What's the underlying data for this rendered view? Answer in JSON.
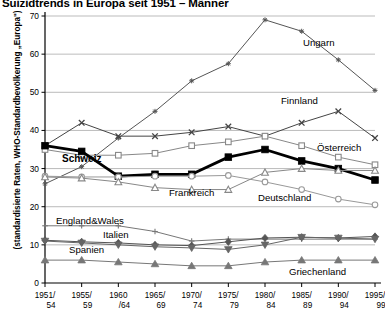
{
  "chart": {
    "title": "Suizidtrends in Europa seit 1951 – Männer",
    "y_axis_title": "(standardisierte Raten, WHO-Standardbevölkerung „Europa\")"
  },
  "chart_data": {
    "type": "line",
    "title": "Suizidtrends in Europa seit 1951 – Männer",
    "xlabel": "",
    "ylabel": "(standardisierte Raten, WHO-Standardbevölkerung „Europa\")",
    "ylim": [
      0,
      70
    ],
    "yticks": [
      0,
      10,
      20,
      30,
      40,
      50,
      60,
      70
    ],
    "grid": true,
    "legend": "inline-annotations",
    "categories": [
      "1951/\n54",
      "1955/\n59",
      "1960\n/64",
      "1965/\n69",
      "1970/\n74",
      "1975/\n79",
      "1980/\n84",
      "1985/\n89",
      "1990/\n94",
      "1995/\n99"
    ],
    "category_labels_top": [
      "1951/",
      "1955/",
      "1960",
      "1965/",
      "1970/",
      "1975/",
      "1980/",
      "1985/",
      "1990/",
      "1995/"
    ],
    "category_labels_bottom": [
      "54",
      "59",
      "/64",
      "69",
      "74",
      "79",
      "84",
      "89",
      "94",
      "99"
    ],
    "series": [
      {
        "name": "Ungarn",
        "marker": "star",
        "color": "#555555",
        "values": [
          26.0,
          30.5,
          38.0,
          45.0,
          53.0,
          57.5,
          69.0,
          66.0,
          58.5,
          50.5
        ]
      },
      {
        "name": "Finnland",
        "marker": "x",
        "color": "#444444",
        "values": [
          36.0,
          42.0,
          38.5,
          38.5,
          39.5,
          41.0,
          38.5,
          42.0,
          45.0,
          38.0
        ]
      },
      {
        "name": "Österreich",
        "marker": "open-square",
        "color": "#888888",
        "values": [
          35.0,
          33.5,
          33.5,
          34.0,
          36.0,
          37.0,
          38.5,
          36.0,
          33.0,
          31.0
        ]
      },
      {
        "name": "Schweiz",
        "marker": "filled-square",
        "color": "#000000",
        "values": [
          36.0,
          34.5,
          28.0,
          28.5,
          28.5,
          33.0,
          35.0,
          32.0,
          30.0,
          27.0
        ]
      },
      {
        "name": "Deutschland",
        "marker": "open-circle",
        "color": "#999999",
        "values": [
          28.0,
          27.8,
          27.8,
          28.0,
          28.0,
          28.2,
          26.5,
          24.5,
          22.0,
          20.5
        ]
      },
      {
        "name": "Frankreich",
        "marker": "open-triangle",
        "color": "#888888",
        "values": [
          27.8,
          27.5,
          26.5,
          25.0,
          24.5,
          24.5,
          29.0,
          30.0,
          29.5,
          29.5
        ]
      },
      {
        "name": "England&Wales",
        "marker": "plus",
        "color": "#777777",
        "values": [
          15.0,
          15.0,
          15.0,
          13.5,
          11.0,
          11.5,
          11.5,
          11.5,
          11.5,
          11.5
        ]
      },
      {
        "name": "Italien",
        "marker": "filled-diamond",
        "color": "#555555",
        "values": [
          11.2,
          10.8,
          10.5,
          10.0,
          9.8,
          10.8,
          11.8,
          12.0,
          11.8,
          12.2
        ]
      },
      {
        "name": "Spanien",
        "marker": "filled-down-triangle",
        "color": "#666666",
        "values": [
          11.0,
          10.5,
          10.0,
          9.5,
          9.2,
          8.8,
          10.0,
          12.0,
          11.8,
          11.5
        ]
      },
      {
        "name": "Griechenland",
        "marker": "filled-triangle",
        "color": "#777777",
        "values": [
          6.0,
          6.0,
          5.5,
          5.0,
          4.5,
          4.5,
          5.5,
          6.0,
          6.0,
          6.0
        ]
      }
    ],
    "annotations": [
      {
        "text": "Ungarn",
        "x": 303,
        "y": 46
      },
      {
        "text": "Finnland",
        "x": 281,
        "y": 104
      },
      {
        "text": "Österreich",
        "x": 317,
        "y": 151
      },
      {
        "text": "Schweiz",
        "x": 62,
        "y": 162
      },
      {
        "text": "Deutschland",
        "x": 258,
        "y": 201
      },
      {
        "text": "Frankreich",
        "x": 169,
        "y": 196
      },
      {
        "text": "England&Wales",
        "x": 56,
        "y": 224
      },
      {
        "text": "Italien",
        "x": 103,
        "y": 238
      },
      {
        "text": "Spanien",
        "x": 69,
        "y": 253
      },
      {
        "text": "Griechenland",
        "x": 289,
        "y": 275
      }
    ]
  }
}
